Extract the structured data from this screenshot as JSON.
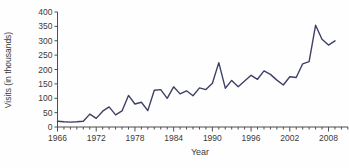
{
  "chart_data": {
    "type": "line",
    "title": "",
    "xlabel": "Year",
    "ylabel": "Visits (in thousands)",
    "x": [
      1966,
      1967,
      1968,
      1969,
      1970,
      1971,
      1972,
      1973,
      1974,
      1975,
      1976,
      1977,
      1978,
      1979,
      1980,
      1981,
      1982,
      1983,
      1984,
      1985,
      1986,
      1987,
      1988,
      1989,
      1990,
      1991,
      1992,
      1993,
      1994,
      1995,
      1996,
      1997,
      1998,
      1999,
      2000,
      2001,
      2002,
      2003,
      2004,
      2005,
      2006,
      2007,
      2008,
      2009
    ],
    "values": [
      20,
      18,
      17,
      18,
      20,
      45,
      30,
      55,
      70,
      42,
      56,
      110,
      80,
      86,
      57,
      128,
      130,
      100,
      140,
      115,
      126,
      109,
      136,
      130,
      152,
      224,
      135,
      162,
      140,
      160,
      180,
      166,
      195,
      183,
      163,
      146,
      175,
      172,
      220,
      227,
      354,
      305,
      285,
      300
    ],
    "ylim": [
      0,
      400
    ],
    "yticks": [
      0,
      50,
      100,
      150,
      200,
      250,
      300,
      350,
      400
    ],
    "xtick_labeled_years": [
      1966,
      1972,
      1978,
      1984,
      1990,
      1996,
      2002,
      2008
    ],
    "xtick_minor_step_years": 1,
    "x_axis_last_tick_year": 2011,
    "grid": "off",
    "legend": "none",
    "line_color": "#3e4066",
    "axis_color": "#4d4d4d",
    "text_color": "#3a3a3a",
    "background": "#fefefe"
  }
}
